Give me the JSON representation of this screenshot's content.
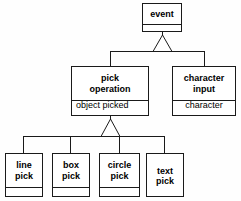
{
  "diagram": {
    "type": "uml-class-generalization-hierarchy",
    "background_color": "#fefefe",
    "line_color": "#1a1a1a",
    "box_fill": "#ffffff",
    "text_color": "#000000",
    "nodes": [
      {
        "id": "event",
        "title": "event",
        "attributes": [],
        "tier": "root",
        "box": {
          "x": 142,
          "y": 3,
          "w": 40,
          "h": 29
        },
        "title_h": 20,
        "font_size": 9
      },
      {
        "id": "pick-operation",
        "title": "pick\noperation",
        "attributes": [
          "object picked"
        ],
        "tier": "middle",
        "box": {
          "x": 71,
          "y": 66,
          "w": 78,
          "h": 50
        },
        "title_h": 33,
        "font_size": 9,
        "attr_font_size": 9
      },
      {
        "id": "character-input",
        "title": "character\ninput",
        "attributes": [
          "character"
        ],
        "tier": "middle",
        "box": {
          "x": 172,
          "y": 66,
          "w": 64,
          "h": 50
        },
        "title_h": 33,
        "font_size": 9,
        "attr_font_size": 9
      },
      {
        "id": "line-pick",
        "title": "line\npick",
        "attributes": [],
        "tier": "leaf",
        "box": {
          "x": 5,
          "y": 153,
          "w": 38,
          "h": 44
        },
        "title_h": 33,
        "font_size": 9
      },
      {
        "id": "box-pick",
        "title": "box\npick",
        "attributes": [],
        "tier": "leaf",
        "box": {
          "x": 52,
          "y": 153,
          "w": 38,
          "h": 44
        },
        "title_h": 33,
        "font_size": 9
      },
      {
        "id": "circle-pick",
        "title": "circle\npick",
        "attributes": [],
        "tier": "leaf",
        "box": {
          "x": 99,
          "y": 153,
          "w": 41,
          "h": 44
        },
        "title_h": 33,
        "font_size": 9
      },
      {
        "id": "text-pick",
        "title": "text\npick",
        "attributes": [],
        "tier": "leaf",
        "box": {
          "x": 146,
          "y": 153,
          "w": 38,
          "h": 44
        },
        "title_h": 44,
        "font_size": 9
      }
    ],
    "generalizations": [
      {
        "id": "gen-event",
        "parent": "event",
        "children": [
          "pick-operation",
          "character-input"
        ],
        "triangle_apex_x": 162,
        "triangle_apex_y": 35,
        "triangle_half_width": 9,
        "triangle_base_y": 51
      },
      {
        "id": "gen-pick-operation",
        "parent": "pick-operation",
        "children": [
          "line-pick",
          "box-pick",
          "circle-pick",
          "text-pick"
        ],
        "triangle_apex_x": 110,
        "triangle_apex_y": 119,
        "triangle_half_width": 9,
        "triangle_base_y": 136,
        "note": "hollow triangle generalization symbol"
      }
    ]
  }
}
